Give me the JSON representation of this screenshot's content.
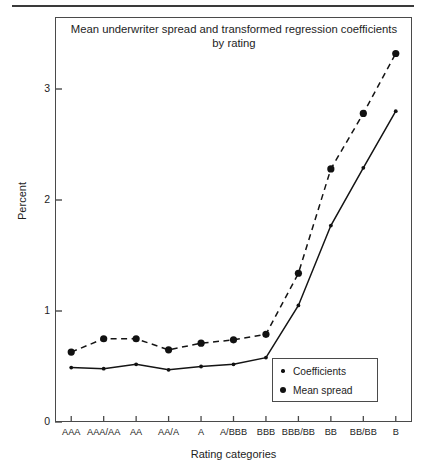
{
  "figure": {
    "title": "Mean underwriter spread and transformed regression coefficients by rating",
    "title_line1": "Mean underwriter spread and transformed regression coefficients",
    "title_line2": "by rating"
  },
  "axes": {
    "ylabel": "Percent",
    "xlabel": "Rating categories",
    "ytick_labels": [
      "0",
      "1",
      "2",
      "3"
    ],
    "xtick_labels": [
      "AAA",
      "AAA/AA",
      "AA",
      "AA/A",
      "A",
      "A/BBB",
      "BBB",
      "BBB/BB",
      "BB",
      "BB/BB",
      "B"
    ]
  },
  "legend": {
    "items": [
      {
        "label": "Coefficients",
        "marker": "small-dot",
        "line": "solid",
        "color": "#111111"
      },
      {
        "label": "Mean spread",
        "marker": "large-dot",
        "line": "dashed",
        "color": "#111111"
      }
    ]
  },
  "chart_data": {
    "type": "line",
    "title": "Mean underwriter spread and transformed regression coefficients by rating",
    "xlabel": "Rating categories",
    "ylabel": "Percent",
    "categories": [
      "AAA",
      "AAA/AA",
      "AA",
      "AA/A",
      "A",
      "A/BBB",
      "BBB",
      "BBB/BB",
      "BB",
      "BB/BB",
      "B"
    ],
    "ylim": [
      0,
      3.5
    ],
    "yticks": [
      0,
      1,
      2,
      3
    ],
    "grid": false,
    "legend_position": "lower right",
    "series": [
      {
        "name": "Coefficients",
        "style": "solid",
        "marker": "small-dot",
        "values": [
          0.49,
          0.48,
          0.52,
          0.47,
          0.5,
          0.52,
          0.58,
          1.05,
          1.77,
          2.29,
          2.8
        ]
      },
      {
        "name": "Mean spread",
        "style": "dashed",
        "marker": "large-dot",
        "values": [
          0.63,
          0.75,
          0.75,
          0.65,
          0.71,
          0.74,
          0.79,
          1.34,
          2.28,
          2.78,
          3.32
        ]
      }
    ]
  }
}
